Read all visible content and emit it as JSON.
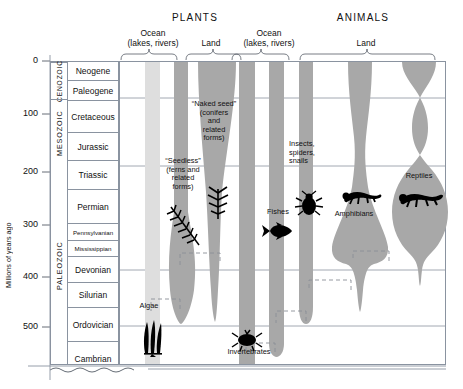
{
  "figure": {
    "y_axis_title": "Millions of years ago",
    "y_ticks": [
      "0",
      "100",
      "200",
      "300",
      "400",
      "500"
    ],
    "y_tick_values": [
      0,
      100,
      200,
      300,
      400,
      500
    ]
  },
  "headers": {
    "plants": "PLANTS",
    "animals": "ANIMALS"
  },
  "brackets": [
    {
      "name": "plants-ocean",
      "line1": "Ocean",
      "line2": "(lakes, rivers)"
    },
    {
      "name": "plants-land",
      "line1": "Land",
      "line2": ""
    },
    {
      "name": "animals-ocean",
      "line1": "Ocean",
      "line2": "(lakes, rivers)"
    },
    {
      "name": "animals-land",
      "line1": "Land",
      "line2": ""
    }
  ],
  "eras": [
    {
      "name": "CENOZOIC",
      "start": 0,
      "end": 66
    },
    {
      "name": "MESOZOIC",
      "start": 66,
      "end": 252
    },
    {
      "name": "PALEOZOIC",
      "start": 252,
      "end": 541
    }
  ],
  "periods": [
    {
      "name": "Neogene",
      "start": 0,
      "end": 23,
      "small": false
    },
    {
      "name": "Paleogene",
      "start": 23,
      "end": 66,
      "small": false
    },
    {
      "name": "Cretaceous",
      "start": 66,
      "end": 145,
      "small": false
    },
    {
      "name": "Jurassic",
      "start": 145,
      "end": 201,
      "small": false
    },
    {
      "name": "Triassic",
      "start": 201,
      "end": 252,
      "small": false
    },
    {
      "name": "Permian",
      "start": 252,
      "end": 299,
      "small": false
    },
    {
      "name": "Pennsylvanian",
      "start": 299,
      "end": 323,
      "small": true
    },
    {
      "name": "Mississippian",
      "start": 323,
      "end": 359,
      "small": true
    },
    {
      "name": "Devonian",
      "start": 359,
      "end": 419,
      "small": false
    },
    {
      "name": "Silurian",
      "start": 419,
      "end": 444,
      "small": false
    },
    {
      "name": "Ordovician",
      "start": 444,
      "end": 485,
      "small": false
    },
    {
      "name": "Cambrian",
      "start": 485,
      "end": 541,
      "small": false
    }
  ],
  "groups": [
    {
      "name": "algae",
      "label": "Algae",
      "kingdom": "plants",
      "habitat": "ocean",
      "shade": "light"
    },
    {
      "name": "seedless",
      "label": "“Seedless” (ferns and related forms)",
      "kingdom": "plants",
      "habitat": "ocean",
      "shade": "dark"
    },
    {
      "name": "naked-seed",
      "label": "“Naked seed” (conifers and related forms)",
      "kingdom": "plants",
      "habitat": "land",
      "shade": "dark"
    },
    {
      "name": "invertebrates",
      "label": "Invertebrates",
      "kingdom": "animals",
      "habitat": "ocean",
      "shade": "dark"
    },
    {
      "name": "fishes",
      "label": "Fishes",
      "kingdom": "animals",
      "habitat": "ocean",
      "shade": "dark"
    },
    {
      "name": "insects",
      "label": "Insects, spiders, snails",
      "kingdom": "animals",
      "habitat": "land",
      "shade": "dark"
    },
    {
      "name": "amphibians",
      "label": "Amphibians",
      "kingdom": "animals",
      "habitat": "land",
      "shade": "dark"
    },
    {
      "name": "reptiles",
      "label": "Reptiles",
      "kingdom": "animals",
      "habitat": "land",
      "shade": "dark"
    }
  ],
  "labels": {
    "algae": "Algae",
    "seedless_l1": "“Seedless”",
    "seedless_l2": "(ferns and",
    "seedless_l3": "related",
    "seedless_l4": "forms)",
    "nakedseed_l1": "“Naked seed”",
    "nakedseed_l2": "(conifers",
    "nakedseed_l3": "and",
    "nakedseed_l4": "related",
    "nakedseed_l5": "forms)",
    "invertebrates": "Invertebrates",
    "fishes": "Fishes",
    "insects_l1": "Insects,",
    "insects_l2": "spiders,",
    "insects_l3": "snails",
    "amphibians": "Amphibians",
    "reptiles": "Reptiles"
  },
  "colors": {
    "band_dark": "#a8a8a8",
    "band_light": "#dedede",
    "grid_line": "#8a93a0",
    "frame": "#555c66",
    "text": "#111111",
    "silhouette": "#000000"
  }
}
